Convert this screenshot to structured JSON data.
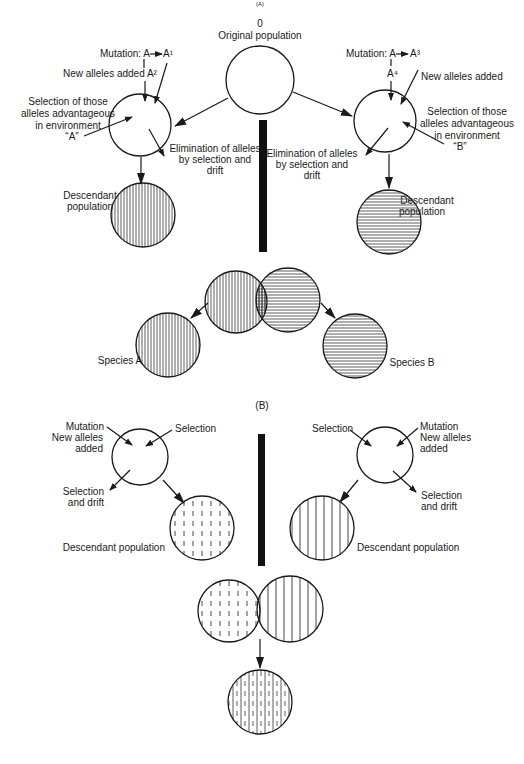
{
  "diagram": {
    "partA": {
      "header_mark": "(A)",
      "original": {
        "number": "0",
        "label": "Original population"
      },
      "left": {
        "mutation": "Mutation: A",
        "allele1": "A¹",
        "new_alleles": "New alleles added A²",
        "selection": [
          "Selection of those",
          "alleles advantageous",
          "in environment",
          "“A”"
        ],
        "elimination": [
          "Elimination of alleles",
          "by selection and",
          "drift"
        ],
        "descendant": [
          "Descendant",
          "population"
        ]
      },
      "right": {
        "mutation": "Mutation: A",
        "allele3": "A³",
        "allele4": "A⁴",
        "new_alleles": "New alleles added",
        "selection": [
          "Selection of those",
          "alleles advantageous",
          "in environment",
          "“B”"
        ],
        "elimination": [
          "Elimination of alleles",
          "by selection and",
          "drift"
        ],
        "descendant": [
          "Descendant",
          "population"
        ]
      },
      "species_a": "Species A",
      "species_b": "Species B"
    },
    "partB": {
      "header": "(B)",
      "left": {
        "mutation": "Mutation",
        "new_alleles": [
          "New alleles",
          "added"
        ],
        "selection": "Selection",
        "selection_drift": [
          "Selection",
          "and drift"
        ],
        "descendant": "Descendant population"
      },
      "right": {
        "selection": "Selection",
        "mutation": "Mutation",
        "new_alleles": [
          "New alleles",
          "added"
        ],
        "selection_drift": [
          "Selection",
          "and drift"
        ],
        "descendant": "Descendant population"
      }
    }
  }
}
